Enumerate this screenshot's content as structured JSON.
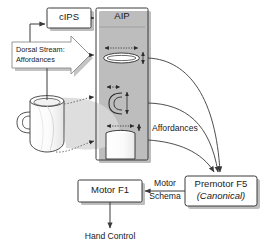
{
  "diagram": {
    "background": "#ffffff",
    "line_color": "#3a3a3a",
    "box_fill": "#ffffff",
    "shadow_color": "#b8b8b8"
  },
  "boxes": {
    "cips": {
      "label": "cIPS",
      "x": 47,
      "y": 8,
      "w": 44,
      "h": 20
    },
    "aip": {
      "label": "AIP",
      "x": 96,
      "y": 8,
      "w": 52,
      "h": 152
    },
    "motor_f1": {
      "label": "Motor F1",
      "x": 78,
      "y": 180,
      "w": 64,
      "h": 22
    },
    "premotor_f5": {
      "label_line1": "Premotor F5",
      "label_line2": "(Canonical)",
      "x": 185,
      "y": 176,
      "w": 72,
      "h": 30
    }
  },
  "callout": {
    "line1": "Dorsal Stream:",
    "line2": "Affordances",
    "x": 12,
    "y": 42,
    "w": 68,
    "h": 32
  },
  "labels": {
    "affordances": "Affordances",
    "motor_schema_line1": "Motor",
    "motor_schema_line2": "Schema",
    "hand_control": "Hand Control"
  },
  "icons": {
    "mug": "coffee-mug-icon",
    "ellipse": "ellipse-aperture-icon",
    "handle": "c-handle-icon",
    "cylinder": "cylinder-icon",
    "dorsal_arrow": "block-arrow-icon"
  }
}
